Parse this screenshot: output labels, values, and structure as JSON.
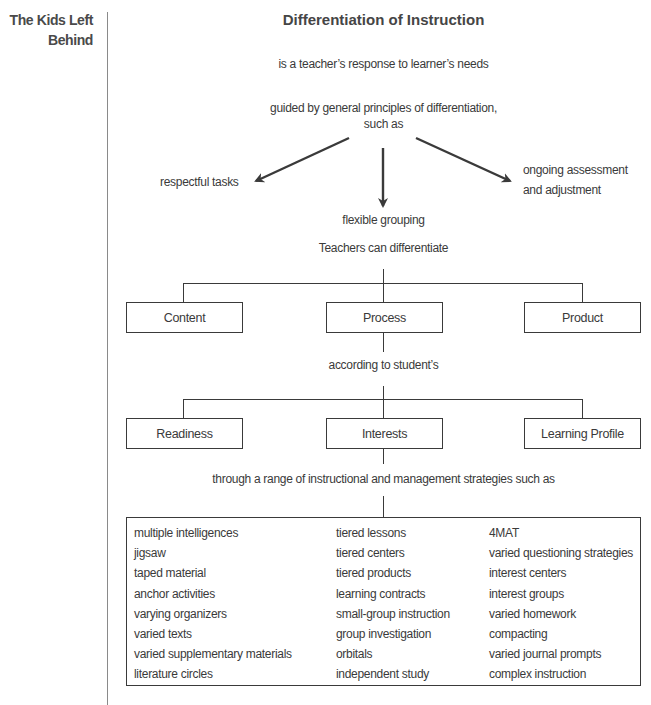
{
  "running_head": {
    "line1": "The Kids Left",
    "line2": "Behind"
  },
  "diagram": {
    "title": "Differentiation of Instruction",
    "definition": "is a teacher’s response to learner’s needs",
    "guided_line1": "guided by general principles of differentiation,",
    "guided_line2": "such as",
    "principles": {
      "left": "respectful  tasks",
      "center": "flexible grouping",
      "right_line1": "ongoing assessment",
      "right_line2": "and adjustment"
    },
    "teachers_can": "Teachers can differentiate",
    "differentiate": [
      {
        "label": "Content"
      },
      {
        "label": "Process"
      },
      {
        "label": "Product"
      }
    ],
    "according_to": "according to student’s",
    "student_traits": [
      {
        "label": "Readiness"
      },
      {
        "label": "Interests"
      },
      {
        "label": "Learning Profile"
      }
    ],
    "through": "through a range of instructional and management strategies such as",
    "strategies": {
      "col1": [
        "multiple intelligences",
        "jigsaw",
        "taped material",
        "anchor activities",
        "varying organizers",
        "varied texts",
        "varied supplementary materials",
        "literature circles"
      ],
      "col2": [
        "tiered lessons",
        "tiered centers",
        "tiered products",
        "learning contracts",
        "small-group instruction",
        "group investigation",
        "orbitals",
        "independent study"
      ],
      "col3": [
        "4MAT",
        "varied questioning strategies",
        "interest centers",
        "interest groups",
        "varied homework",
        "compacting",
        "varied journal prompts",
        "complex instruction"
      ]
    },
    "colors": {
      "ink": "#3a3a3a",
      "title": "#454545",
      "rule": "#8a8a8a"
    }
  }
}
